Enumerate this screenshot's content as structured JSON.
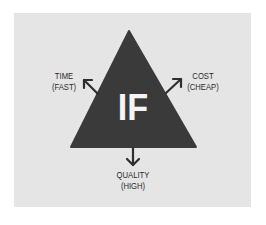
{
  "diagram": {
    "center_label": "IF",
    "colors": {
      "background": "#ffffff",
      "panel": "#e5e5e5",
      "triangle": "#3a3a3a",
      "center_text": "#f4f4f4",
      "text": "#2a2a2a"
    },
    "labels": {
      "left": {
        "line1": "TIME",
        "line2": "(FAST)"
      },
      "right": {
        "line1": "COST",
        "line2": "(CHEAP)"
      },
      "bottom": {
        "line1": "QUALITY",
        "line2": "(HIGH)"
      }
    },
    "icons": {
      "left_arrow": "arrow-up-left",
      "right_arrow": "arrow-up-right",
      "bottom_arrow": "arrow-down"
    }
  }
}
